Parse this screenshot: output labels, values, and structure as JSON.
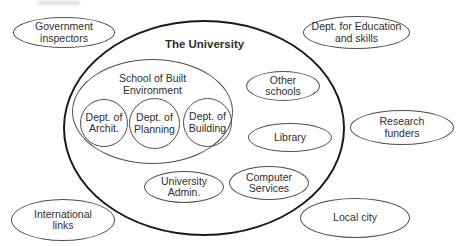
{
  "diagram": {
    "title": "The University",
    "inside": {
      "school": {
        "line1": "School of Built",
        "line2": "Environment"
      },
      "dept_archit": {
        "line1": "Dept. of",
        "line2": "Archit."
      },
      "dept_planning": {
        "line1": "Dept. of",
        "line2": "Planning"
      },
      "dept_building": {
        "line1": "Dept. of",
        "line2": "Building"
      },
      "other_schools": {
        "line1": "Other",
        "line2": "schools"
      },
      "library": {
        "line1": "Library"
      },
      "university_admin": {
        "line1": "University",
        "line2": "Admin."
      },
      "computer_services": {
        "line1": "Computer",
        "line2": "Services"
      }
    },
    "outside": {
      "government_inspectors": {
        "line1": "Government",
        "line2": "inspectors"
      },
      "dept_education": {
        "line1": "Dept. for Education",
        "line2": "and skills"
      },
      "research_funders": {
        "line1": "Research",
        "line2": "funders"
      },
      "international_links": {
        "line1": "International",
        "line2": "links"
      },
      "local_city": {
        "line1": "Local city"
      }
    }
  }
}
